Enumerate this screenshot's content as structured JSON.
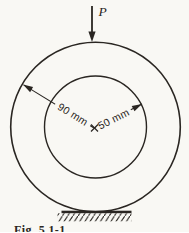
{
  "figure": {
    "force_label": "P",
    "outer_radius_label": "90 mm",
    "inner_radius_label": "50 mm",
    "caption": "Fig. 5.1-1",
    "colors": {
      "ink": "#2a2622",
      "paper": "#f9f8f4"
    }
  }
}
